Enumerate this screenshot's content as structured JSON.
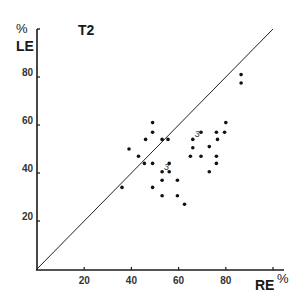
{
  "chart_data": {
    "type": "scatter",
    "title": "T2",
    "xlabel": "RE",
    "xlabel_unit": "%",
    "ylabel": "LE",
    "ylabel_unit": "%",
    "xlim": [
      0,
      104
    ],
    "ylim": [
      0,
      100
    ],
    "x_ticks": [
      20,
      40,
      60,
      80,
      100
    ],
    "x_tick_labels": [
      "20",
      "40",
      "60",
      "80"
    ],
    "y_ticks": [
      20,
      40,
      60,
      80
    ],
    "y_tick_labels": [
      "20",
      "40",
      "60",
      "80"
    ],
    "grid": false,
    "legend": null,
    "reference_line": {
      "label": "identity",
      "from": [
        0,
        0
      ],
      "to": [
        100,
        100
      ]
    },
    "points": [
      {
        "x": 36,
        "y": 34
      },
      {
        "x": 39,
        "y": 50
      },
      {
        "x": 43,
        "y": 47
      },
      {
        "x": 45.5,
        "y": 44
      },
      {
        "x": 46,
        "y": 54
      },
      {
        "x": 49,
        "y": 61
      },
      {
        "x": 49,
        "y": 57
      },
      {
        "x": 49,
        "y": 44
      },
      {
        "x": 49,
        "y": 34
      },
      {
        "x": 53,
        "y": 54
      },
      {
        "x": 53,
        "y": 40.5,
        "count": 3
      },
      {
        "x": 53,
        "y": 37
      },
      {
        "x": 53,
        "y": 30.5
      },
      {
        "x": 55.5,
        "y": 54
      },
      {
        "x": 56,
        "y": 44
      },
      {
        "x": 56,
        "y": 40.5
      },
      {
        "x": 59.5,
        "y": 37
      },
      {
        "x": 59.5,
        "y": 30.5
      },
      {
        "x": 62.5,
        "y": 27
      },
      {
        "x": 65,
        "y": 47
      },
      {
        "x": 66,
        "y": 50.5
      },
      {
        "x": 66,
        "y": 54,
        "count": 3
      },
      {
        "x": 69.5,
        "y": 57
      },
      {
        "x": 69.5,
        "y": 47
      },
      {
        "x": 73,
        "y": 51
      },
      {
        "x": 73,
        "y": 40.5
      },
      {
        "x": 76,
        "y": 57
      },
      {
        "x": 76.5,
        "y": 54
      },
      {
        "x": 76,
        "y": 47
      },
      {
        "x": 76,
        "y": 44
      },
      {
        "x": 79.5,
        "y": 57
      },
      {
        "x": 80,
        "y": 61
      },
      {
        "x": 86.5,
        "y": 81
      },
      {
        "x": 86.5,
        "y": 77.5
      }
    ],
    "annotations": [
      {
        "text": "3",
        "x": 53,
        "y": 40.5
      },
      {
        "text": "3",
        "x": 66,
        "y": 54
      }
    ]
  },
  "labels": {
    "title": "T2",
    "y_unit": "%",
    "y_name": "LE",
    "x_name": "RE",
    "x_unit": "%"
  }
}
